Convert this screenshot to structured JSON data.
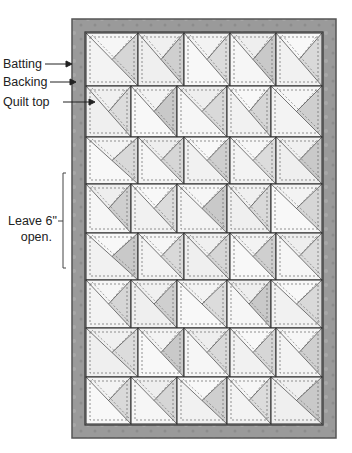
{
  "diagram": {
    "labels": {
      "batting": "Batting",
      "backing": "Backing",
      "quilt_top": "Quilt top",
      "leave_open_line1": "Leave 6\"",
      "leave_open_line2": "open."
    },
    "grid": {
      "rows": 8,
      "blocks_per_row": 5,
      "row_bounds_y": [
        33,
        86,
        137,
        184,
        233,
        280,
        328,
        377,
        424
      ],
      "odd_row_columns_x": [
        86,
        138,
        184,
        230,
        276,
        322
      ],
      "even_row_columns_x": [
        86,
        131,
        177,
        227,
        271,
        322
      ],
      "block_pattern": "quarter-square triangle with diagonal and stitching"
    },
    "colors": {
      "backing": "#9a9a9a",
      "backing_edge": "#555555",
      "batting": "#f4f4f4",
      "block_light": "#f3f3f3",
      "block_shade": "#d2d2d2",
      "line": "#333333",
      "stitch": "#666666"
    }
  }
}
